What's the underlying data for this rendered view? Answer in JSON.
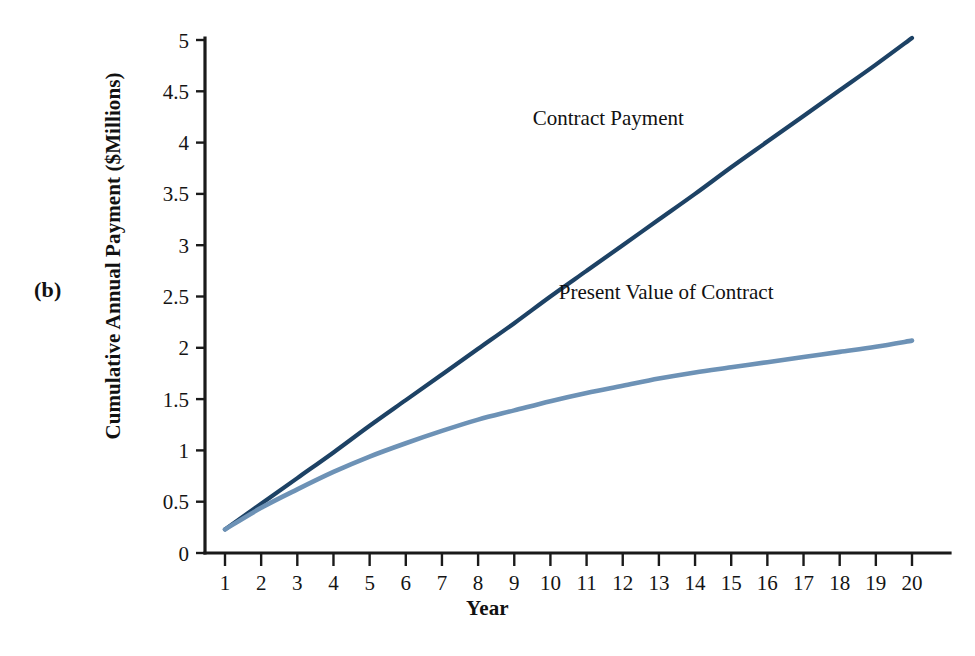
{
  "figure": {
    "panel_letter": "(b)",
    "background_color": "#ffffff"
  },
  "chart_data": {
    "type": "line",
    "title": "",
    "subtitle": "",
    "xlabel": "Year",
    "ylabel": "Cumulative Annual Payment ($Millions)",
    "xlim": [
      1,
      20
    ],
    "ylim": [
      0,
      5
    ],
    "grid": false,
    "legend_position": "inline-annotation",
    "x_tick_labels": [
      "1",
      "2",
      "3",
      "4",
      "5",
      "6",
      "7",
      "8",
      "9",
      "10",
      "11",
      "12",
      "13",
      "14",
      "15",
      "16",
      "17",
      "18",
      "19",
      "20"
    ],
    "y_tick_labels": [
      "0",
      "0.5",
      "1",
      "1.5",
      "2",
      "2.5",
      "3",
      "3.5",
      "4",
      "4.5",
      "5"
    ],
    "x": [
      1,
      2,
      3,
      4,
      5,
      6,
      7,
      8,
      9,
      10,
      11,
      12,
      13,
      14,
      15,
      16,
      17,
      18,
      19,
      20
    ],
    "series": [
      {
        "name": "Contract Payment",
        "color": "#1d4265",
        "stroke_width": 4.2,
        "label_x": 11.6,
        "label_y": 4.17,
        "values": [
          0.23,
          0.48,
          0.73,
          0.98,
          1.24,
          1.49,
          1.74,
          1.99,
          2.24,
          2.5,
          2.75,
          3.0,
          3.25,
          3.5,
          3.76,
          4.01,
          4.26,
          4.51,
          4.76,
          5.02
        ]
      },
      {
        "name": "Present Value of Contract",
        "color": "#6d92b6",
        "stroke_width": 4.6,
        "label_x": 13.2,
        "label_y": 2.48,
        "values": [
          0.23,
          0.44,
          0.62,
          0.79,
          0.94,
          1.07,
          1.19,
          1.3,
          1.39,
          1.48,
          1.56,
          1.63,
          1.7,
          1.76,
          1.81,
          1.86,
          1.91,
          1.96,
          2.01,
          2.07
        ]
      }
    ]
  }
}
